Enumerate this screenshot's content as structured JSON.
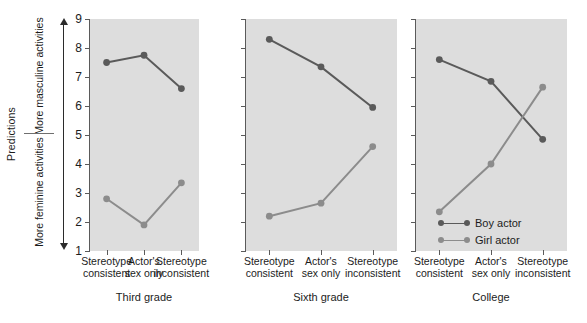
{
  "axis": {
    "outer_label": "Predictions",
    "upper_label": "More masculine activities",
    "lower_label": "More feminine activities",
    "y_ticks": [
      "9",
      "8",
      "7",
      "6",
      "5",
      "4",
      "3",
      "2",
      "1"
    ]
  },
  "legend": {
    "position": "inside-right-panel-lower-left",
    "entries": [
      {
        "label": "Boy actor",
        "color": "#5a5a5a"
      },
      {
        "label": "Girl actor",
        "color": "#8c8c8c"
      }
    ]
  },
  "colors": {
    "plot_background": "#dddddd",
    "axis": "#5a5a5a",
    "boy_actor": "#5a5a5a",
    "girl_actor": "#8c8c8c",
    "text": "#1c1c1c"
  },
  "chart_data": {
    "type": "line",
    "title": "",
    "xlabel": "",
    "ylabel": "Predictions",
    "ylim": [
      1,
      9
    ],
    "yticks": [
      1,
      2,
      3,
      4,
      5,
      6,
      7,
      8,
      9
    ],
    "grid": false,
    "legend_position": "lower-left of third panel",
    "axis_annotations": {
      "upper_half": "More masculine activities",
      "lower_half": "More feminine activities"
    },
    "categories": [
      "Stereotype consistent",
      "Actor's sex only",
      "Stereotype inconsistent"
    ],
    "panels": [
      {
        "name": "Third grade",
        "series": [
          {
            "name": "Boy actor",
            "values": [
              7.5,
              7.75,
              6.6
            ]
          },
          {
            "name": "Girl actor",
            "values": [
              2.8,
              1.9,
              3.35
            ]
          }
        ]
      },
      {
        "name": "Sixth grade",
        "series": [
          {
            "name": "Boy actor",
            "values": [
              8.3,
              7.35,
              5.95
            ]
          },
          {
            "name": "Girl actor",
            "values": [
              2.2,
              2.65,
              4.6
            ]
          }
        ]
      },
      {
        "name": "College",
        "series": [
          {
            "name": "Boy actor",
            "values": [
              7.6,
              6.85,
              4.85
            ]
          },
          {
            "name": "Girl actor",
            "values": [
              2.35,
              4.0,
              6.65
            ]
          }
        ]
      }
    ]
  }
}
